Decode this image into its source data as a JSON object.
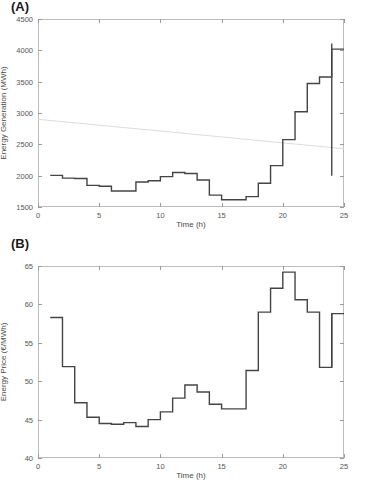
{
  "figure": {
    "background": "#ffffff",
    "line_color": "#444444",
    "trend_color": "#d8d8d8",
    "axis_color": "#bdbdbd"
  },
  "panels": [
    {
      "id": "A",
      "label": "(A)"
    },
    {
      "id": "B",
      "label": "(B)"
    }
  ],
  "chart_data": [
    {
      "type": "line",
      "panel": "(A)",
      "title": "",
      "xlabel": "Time (h)",
      "ylabel": "Energy Generation (MWh)",
      "xlim": [
        0,
        25
      ],
      "ylim": [
        1500,
        4500
      ],
      "xticks": [
        0,
        5,
        10,
        15,
        20,
        25
      ],
      "yticks": [
        1500,
        2000,
        2500,
        3000,
        3500,
        4000,
        4500
      ],
      "grid": false,
      "legend": null,
      "drawstyle": "steps-post",
      "x": [
        1,
        2,
        3,
        4,
        5,
        6,
        7,
        8,
        9,
        10,
        11,
        12,
        13,
        14,
        15,
        16,
        17,
        18,
        19,
        20,
        21,
        22,
        23,
        24
      ],
      "series": [
        {
          "name": "Energy Generation",
          "color": "#444444",
          "values": [
            2005,
            1960,
            1955,
            1845,
            1830,
            1755,
            1755,
            1900,
            1920,
            1985,
            2050,
            2035,
            1930,
            1880,
            1690,
            1640,
            1615,
            1615,
            1665,
            1660,
            1880,
            2160,
            2575,
            3020,
            3470,
            3505,
            3575,
            4020,
            4110
          ]
        },
        {
          "name": "Energy Generation (hourly steps)",
          "color": "#444444",
          "values": [
            2005,
            1960,
            1955,
            1845,
            1830,
            1755,
            1755,
            1900,
            1920,
            1985,
            2050,
            2035,
            1930,
            1690,
            1615,
            1615,
            1665,
            1880,
            2160,
            2575,
            3020,
            3470,
            3575,
            4020,
            4110
          ]
        }
      ],
      "values": [
        2005,
        1960,
        1955,
        1845,
        1830,
        1755,
        1755,
        1900,
        1920,
        1985,
        2050,
        2035,
        1930,
        1690,
        1615,
        1615,
        1665,
        1880,
        2160,
        2575,
        3020,
        3470,
        3575,
        4020,
        4110
      ],
      "terminal_drop": {
        "x": 24,
        "from": 4110,
        "to": 2000
      },
      "trendline": {
        "x": [
          0,
          25
        ],
        "y": [
          2900,
          2430
        ],
        "color": "#d8d8d8"
      }
    },
    {
      "type": "line",
      "panel": "(B)",
      "title": "",
      "xlabel": "Time (h)",
      "ylabel": "Energy Price (€/MWh)",
      "xlim": [
        0,
        25
      ],
      "ylim": [
        40,
        65
      ],
      "xticks": [
        0,
        5,
        10,
        15,
        20,
        25
      ],
      "yticks": [
        40,
        45,
        50,
        55,
        60,
        65
      ],
      "grid": false,
      "legend": null,
      "drawstyle": "steps-post",
      "x": [
        1,
        2,
        3,
        4,
        5,
        6,
        7,
        8,
        9,
        10,
        11,
        12,
        13,
        14,
        15,
        16,
        17,
        18,
        19,
        20,
        21,
        22,
        23,
        24
      ],
      "series": [
        {
          "name": "Energy Price",
          "color": "#444444",
          "values": [
            58.3,
            51.9,
            47.2,
            45.3,
            44.5,
            44.4,
            44.6,
            44.1,
            45.0,
            46.0,
            47.8,
            49.5,
            48.6,
            47.0,
            46.4,
            46.4,
            51.4,
            59.0,
            62.1,
            64.2,
            60.6,
            59.0,
            51.8,
            58.8
          ]
        }
      ],
      "values": [
        58.3,
        51.9,
        47.2,
        45.3,
        44.5,
        44.4,
        44.6,
        44.1,
        45.0,
        46.0,
        47.8,
        49.5,
        48.6,
        47.0,
        46.4,
        46.4,
        51.4,
        59.0,
        62.1,
        64.2,
        60.6,
        59.0,
        51.8,
        58.8
      ],
      "terminal_rise": {
        "x": 24,
        "from": 51.8,
        "to": 58.8
      }
    }
  ]
}
